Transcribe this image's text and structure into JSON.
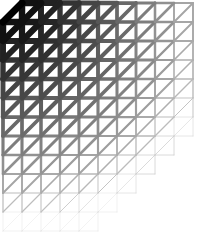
{
  "figure": {
    "name": "graded-triangular-mesh",
    "caption": "",
    "width": 203,
    "height": 232,
    "background_color": "#ffffff",
    "line_color": "#000000"
  },
  "chart_data": {
    "type": "diagram",
    "title": "",
    "subtitle": "",
    "xlabel": "",
    "ylabel": "",
    "grid": true,
    "legend": "none",
    "mesh": {
      "cell_size": 19,
      "origin_x": 3,
      "origin_y": 3,
      "columns": 10,
      "rows": 12,
      "column_heights": [
        12,
        12,
        12,
        12,
        12,
        11,
        10,
        9,
        8,
        7
      ],
      "row_widths": [
        5,
        5,
        5,
        6,
        7,
        8,
        9,
        10,
        10,
        10,
        10,
        10
      ],
      "corner_chamfer": {
        "enabled": true,
        "corner": "top-left",
        "size": 19
      },
      "diagonal_direction": "lower-left-to-upper-right"
    },
    "weight_grading": {
      "mode": "radial-from-top-left",
      "min_stroke_width": 0.35,
      "max_stroke_width": 7.0,
      "min_gray": "#d8d8d8",
      "max_gray": "#000000",
      "falloff_cells": 11,
      "note": "stroke width and darkness decrease with distance from the upper-left corner"
    },
    "x": [
      0,
      1,
      2,
      3,
      4,
      5,
      6,
      7,
      8,
      9
    ],
    "values": [
      12,
      12,
      12,
      12,
      12,
      11,
      10,
      9,
      8,
      7
    ],
    "categories": [
      "c0",
      "c1",
      "c2",
      "c3",
      "c4",
      "c5",
      "c6",
      "c7",
      "c8",
      "c9"
    ]
  }
}
